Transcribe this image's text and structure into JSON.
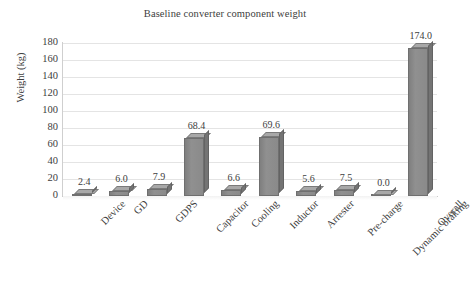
{
  "chart_data": {
    "type": "bar",
    "title": "Baseline converter component weight",
    "xlabel": "",
    "ylabel": "Weight (kg)",
    "ylim": [
      0,
      180
    ],
    "yticks": [
      0,
      20,
      40,
      60,
      80,
      100,
      120,
      140,
      160,
      180
    ],
    "grid": true,
    "legend": false,
    "categories": [
      "Device",
      "GD",
      "GDPS",
      "Capacitor",
      "Cooling",
      "Inductor",
      "Arrester",
      "Pre-charge",
      "Dynamic braking",
      "Overall"
    ],
    "values": [
      2.4,
      6.0,
      7.9,
      68.4,
      6.6,
      69.6,
      5.6,
      7.5,
      0.0,
      174.0
    ],
    "data_labels": [
      "2.4",
      "6.0",
      "7.9",
      "68.4",
      "6.6",
      "69.6",
      "5.6",
      "7.5",
      "0.0",
      "174.0"
    ],
    "bar_color": "#8c8c8c",
    "bar_top_color": "#a8a8a8",
    "bar_side_color": "#747474",
    "grid_color": "#e4e4e4",
    "text_color": "#404040",
    "background": "#ffffff"
  }
}
